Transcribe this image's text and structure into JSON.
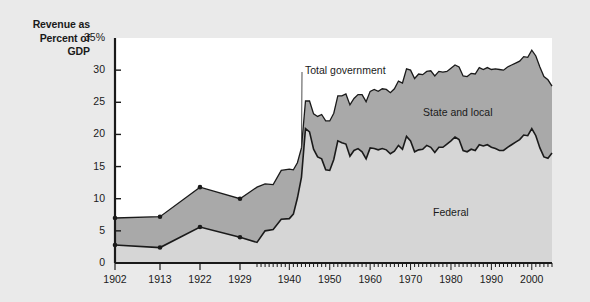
{
  "figure": {
    "axis_title_lines": [
      "Revenue as",
      "Percent of",
      "GDP"
    ],
    "background_color": "#eaeaea",
    "plot_background_color": "#ffffff"
  },
  "annotations": {
    "total_government": "Total government",
    "state_and_local": "State and local",
    "federal": "Federal"
  },
  "chart_data": {
    "type": "area",
    "title": "Revenue as Percent of GDP",
    "xlabel": "",
    "ylabel": "Revenue as Percent of GDP",
    "stacked": true,
    "grid": false,
    "legend_position": "inline-annotations",
    "ylim": [
      0,
      35
    ],
    "ytick_labels": [
      "0",
      "5",
      "10",
      "15",
      "20",
      "25",
      "30",
      "35%"
    ],
    "yticks": [
      0,
      5,
      10,
      15,
      20,
      25,
      30,
      35
    ],
    "xlim": [
      1902,
      2005
    ],
    "xtick_labels": [
      "1902",
      "1913",
      "1922",
      "1929",
      "1940",
      "1950",
      "1960",
      "1970",
      "1980",
      "1990",
      "2000"
    ],
    "xticks": [
      1902,
      1913,
      1922,
      1929,
      1940,
      1950,
      1960,
      1970,
      1980,
      1990,
      2000
    ],
    "x_minor_tick_start": 1932,
    "x_minor_tick_step": 1,
    "series_colors": {
      "federal": "#d6d6d6",
      "state_and_local": "#a9a9a9",
      "line": "#1a1a1a"
    },
    "marker_years": [
      1902,
      1913,
      1922,
      1929
    ],
    "series": [
      {
        "name": "Federal",
        "x": [
          1902,
          1913,
          1922,
          1929,
          1932,
          1934,
          1936,
          1938,
          1940,
          1941,
          1942,
          1943,
          1944,
          1945,
          1946,
          1947,
          1948,
          1949,
          1950,
          1951,
          1952,
          1953,
          1954,
          1955,
          1956,
          1957,
          1958,
          1959,
          1960,
          1961,
          1962,
          1963,
          1964,
          1965,
          1966,
          1967,
          1968,
          1969,
          1970,
          1971,
          1972,
          1973,
          1974,
          1975,
          1976,
          1977,
          1978,
          1979,
          1980,
          1981,
          1982,
          1983,
          1984,
          1985,
          1986,
          1987,
          1988,
          1989,
          1990,
          1991,
          1992,
          1993,
          1994,
          1995,
          1996,
          1997,
          1998,
          1999,
          2000,
          2001,
          2002,
          2003,
          2004,
          2005
        ],
        "values": [
          2.8,
          2.4,
          5.6,
          4.0,
          3.2,
          5.0,
          5.2,
          6.8,
          6.9,
          7.6,
          10.1,
          13.3,
          20.9,
          20.4,
          17.7,
          16.5,
          16.2,
          14.5,
          14.4,
          16.1,
          19.0,
          18.7,
          18.5,
          16.6,
          17.5,
          17.8,
          17.3,
          16.2,
          17.9,
          17.8,
          17.6,
          17.8,
          17.6,
          17.0,
          17.4,
          18.3,
          17.7,
          19.7,
          19.0,
          17.3,
          17.6,
          17.7,
          18.3,
          18.0,
          17.2,
          18.0,
          18.0,
          18.5,
          19.0,
          19.6,
          19.2,
          17.5,
          17.3,
          17.7,
          17.5,
          18.4,
          18.2,
          18.4,
          18.0,
          17.8,
          17.5,
          17.5,
          18.0,
          18.4,
          18.8,
          19.2,
          19.9,
          19.8,
          20.9,
          19.8,
          17.9,
          16.5,
          16.3,
          17.1
        ]
      },
      {
        "name": "State and local",
        "x": [
          1902,
          1913,
          1922,
          1929,
          1932,
          1934,
          1936,
          1938,
          1940,
          1941,
          1942,
          1943,
          1944,
          1945,
          1946,
          1947,
          1948,
          1949,
          1950,
          1951,
          1952,
          1953,
          1954,
          1955,
          1956,
          1957,
          1958,
          1959,
          1960,
          1961,
          1962,
          1963,
          1964,
          1965,
          1966,
          1967,
          1968,
          1969,
          1970,
          1971,
          1972,
          1973,
          1974,
          1975,
          1976,
          1977,
          1978,
          1979,
          1980,
          1981,
          1982,
          1983,
          1984,
          1985,
          1986,
          1987,
          1988,
          1989,
          1990,
          1991,
          1992,
          1993,
          1994,
          1995,
          1996,
          1997,
          1998,
          1999,
          2000,
          2001,
          2002,
          2003,
          2004,
          2005
        ],
        "values": [
          4.2,
          4.8,
          6.2,
          6.0,
          8.6,
          7.3,
          7.0,
          7.6,
          7.7,
          6.9,
          5.5,
          4.6,
          4.3,
          4.8,
          5.5,
          6.3,
          6.9,
          7.6,
          7.7,
          7.2,
          7.0,
          7.3,
          7.8,
          8.0,
          8.1,
          8.4,
          8.9,
          8.9,
          8.8,
          9.2,
          9.1,
          9.3,
          9.4,
          9.5,
          9.7,
          10.0,
          10.3,
          10.5,
          11.0,
          11.4,
          11.8,
          11.6,
          11.5,
          11.9,
          11.9,
          11.8,
          11.7,
          11.3,
          11.3,
          11.2,
          11.3,
          11.6,
          11.7,
          11.8,
          11.9,
          12.0,
          11.9,
          12.0,
          12.1,
          12.4,
          12.6,
          12.5,
          12.5,
          12.4,
          12.3,
          12.2,
          12.2,
          12.2,
          12.2,
          12.4,
          12.6,
          12.5,
          12.2,
          10.4
        ]
      },
      {
        "name": "Total government",
        "x": [
          1902,
          1913,
          1922,
          1929,
          1932,
          1934,
          1936,
          1938,
          1940,
          1941,
          1942,
          1943,
          1944,
          1945,
          1946,
          1947,
          1948,
          1949,
          1950,
          1951,
          1952,
          1953,
          1954,
          1955,
          1956,
          1957,
          1958,
          1959,
          1960,
          1961,
          1962,
          1963,
          1964,
          1965,
          1966,
          1967,
          1968,
          1969,
          1970,
          1971,
          1972,
          1973,
          1974,
          1975,
          1976,
          1977,
          1978,
          1979,
          1980,
          1981,
          1982,
          1983,
          1984,
          1985,
          1986,
          1987,
          1988,
          1989,
          1990,
          1991,
          1992,
          1993,
          1994,
          1995,
          1996,
          1997,
          1998,
          1999,
          2000,
          2001,
          2002,
          2003,
          2004,
          2005
        ],
        "values": [
          7.0,
          7.2,
          11.8,
          10.0,
          11.8,
          12.3,
          12.2,
          14.4,
          14.6,
          14.5,
          15.6,
          17.9,
          25.2,
          25.2,
          23.2,
          22.8,
          23.1,
          22.1,
          22.1,
          23.3,
          26.0,
          26.0,
          26.3,
          24.6,
          25.6,
          26.2,
          26.2,
          25.1,
          26.7,
          27.0,
          26.7,
          27.1,
          27.0,
          26.5,
          27.1,
          28.3,
          28.0,
          30.2,
          30.0,
          28.7,
          29.4,
          29.3,
          29.8,
          29.9,
          29.1,
          29.8,
          29.7,
          29.8,
          30.3,
          30.8,
          30.5,
          29.1,
          29.0,
          29.5,
          29.4,
          30.4,
          30.1,
          30.4,
          30.1,
          30.2,
          30.1,
          30.0,
          30.5,
          30.8,
          31.1,
          31.4,
          32.1,
          32.0,
          33.1,
          32.2,
          30.5,
          29.0,
          28.5,
          27.5
        ]
      }
    ]
  }
}
